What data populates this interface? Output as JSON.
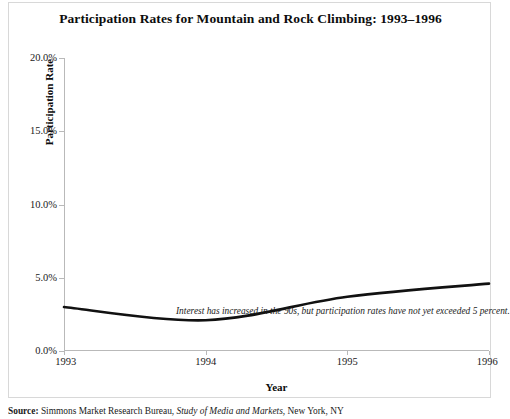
{
  "chart_data": {
    "type": "line",
    "title": "Participation Rates for Mountain and Rock Climbing: 1993–1996",
    "xlabel": "Year",
    "ylabel": "Participation Rate",
    "x": [
      1993,
      1994,
      1995,
      1996
    ],
    "series": [
      {
        "name": "Participation Rate",
        "values": [
          3.0,
          2.1,
          3.7,
          4.6
        ]
      }
    ],
    "xlim": [
      1993,
      1996
    ],
    "ylim": [
      0.0,
      20.0
    ],
    "x_tick_labels": [
      "1993",
      "1994",
      "1995",
      "1996"
    ],
    "y_tick_values": [
      0.0,
      5.0,
      10.0,
      15.0,
      20.0
    ],
    "y_tick_labels": [
      "0.0%",
      "5.0%",
      "10.0%",
      "15.0%",
      "20.0%"
    ],
    "grid": false,
    "legend": false,
    "line_color": "#111111",
    "annotations": [
      "Interest has increased in the 90s, but participation rates have not yet exceeded 5 percent."
    ]
  },
  "source": {
    "label": "Source:",
    "organization": "Simmons Market Research Bureau,",
    "publication": "Study of Media and Markets,",
    "place": "New York, NY"
  }
}
